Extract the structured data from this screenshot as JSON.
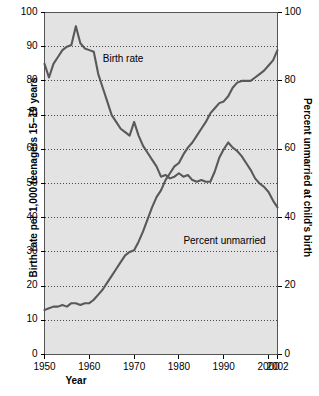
{
  "chart_data": {
    "type": "line",
    "title": "",
    "xlabel": "Year",
    "ylabel": "Birth rate per 1,000 teenagers 15–19 years",
    "ylabel_right": "Percent unmarried at child's birth",
    "grid": true,
    "legend_position": "inline-annotation",
    "xlim": [
      1950,
      2002
    ],
    "ylim": [
      0,
      100
    ],
    "ylim_right": [
      0,
      100
    ],
    "xticks": [
      "1950",
      "1960",
      "1970",
      "1980",
      "1990",
      "2000",
      "2002"
    ],
    "xtick_values": [
      1950,
      1960,
      1970,
      1980,
      1990,
      2000,
      2002
    ],
    "yticks_left": [
      "0",
      "10",
      "20",
      "30",
      "40",
      "50",
      "60",
      "70",
      "80",
      "90",
      "100"
    ],
    "ytick_values_left": [
      0,
      10,
      20,
      30,
      40,
      50,
      60,
      70,
      80,
      90,
      100
    ],
    "yticks_right": [
      "0",
      "20",
      "40",
      "60",
      "80",
      "100"
    ],
    "ytick_values_right": [
      0,
      20,
      40,
      60,
      80,
      100
    ],
    "annotations": [
      {
        "text": "Birth rate",
        "x": 1963,
        "y": 86
      },
      {
        "text": "Percent unmarried",
        "x": 1981,
        "y": 33
      }
    ],
    "x": [
      1950,
      1951,
      1952,
      1953,
      1954,
      1955,
      1956,
      1957,
      1958,
      1959,
      1960,
      1961,
      1962,
      1963,
      1964,
      1965,
      1966,
      1967,
      1968,
      1969,
      1970,
      1971,
      1972,
      1973,
      1974,
      1975,
      1976,
      1977,
      1978,
      1979,
      1980,
      1981,
      1982,
      1983,
      1984,
      1985,
      1986,
      1987,
      1988,
      1989,
      1990,
      1991,
      1992,
      1993,
      1994,
      1995,
      1996,
      1997,
      1998,
      1999,
      2000,
      2001,
      2002
    ],
    "series": [
      {
        "name": "Birth rate",
        "axis": "left",
        "color": "#595959",
        "values": [
          85,
          81,
          85,
          87,
          89,
          90,
          90.5,
          96,
          91,
          89.5,
          89,
          88.5,
          82,
          78,
          74,
          70,
          68,
          66,
          65,
          64,
          68,
          64,
          61,
          59,
          57,
          55,
          52,
          52.5,
          51.5,
          52,
          53,
          52,
          52.5,
          51,
          50.5,
          51,
          50.5,
          50.5,
          53.5,
          57.5,
          60,
          62,
          60.5,
          59.5,
          58,
          56,
          54,
          51.5,
          50,
          49,
          47.5,
          45,
          43
        ]
      },
      {
        "name": "Percent unmarried",
        "axis": "right",
        "color": "#595959",
        "values": [
          13,
          13.5,
          14,
          14,
          14.5,
          14,
          15,
          15,
          14.5,
          15,
          15,
          16,
          17.5,
          19,
          21,
          23,
          25,
          27,
          29,
          30,
          30.5,
          33,
          36,
          39.5,
          43,
          46,
          48,
          51,
          53,
          55,
          56,
          58.5,
          60.5,
          62,
          64,
          66,
          68,
          70.5,
          72,
          73.5,
          74,
          75.5,
          78,
          79.5,
          80,
          80,
          80,
          81,
          82,
          83,
          84.5,
          86,
          89
        ]
      }
    ]
  }
}
